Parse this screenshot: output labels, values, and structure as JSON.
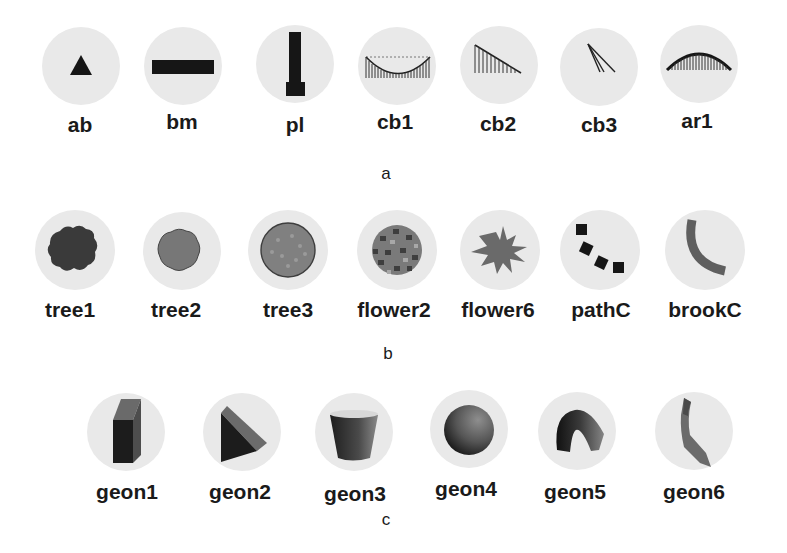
{
  "figure": {
    "panels": [
      {
        "letter": "a",
        "items": [
          {
            "label": "ab",
            "icon": "triangle-icon"
          },
          {
            "label": "bm",
            "icon": "horizontal-bar-icon"
          },
          {
            "label": "pl",
            "icon": "pillar-icon"
          },
          {
            "label": "cb1",
            "icon": "suspension-curve-icon"
          },
          {
            "label": "cb2",
            "icon": "cable-stay-fan-icon"
          },
          {
            "label": "cb3",
            "icon": "cable-lines-icon"
          },
          {
            "label": "ar1",
            "icon": "arch-icon"
          }
        ]
      },
      {
        "letter": "b",
        "items": [
          {
            "label": "tree1",
            "icon": "tree-dark-icon"
          },
          {
            "label": "tree2",
            "icon": "tree-medium-icon"
          },
          {
            "label": "tree3",
            "icon": "tree-textured-icon"
          },
          {
            "label": "flower2",
            "icon": "flower-cluster-icon"
          },
          {
            "label": "flower6",
            "icon": "flower-star-icon"
          },
          {
            "label": "pathC",
            "icon": "stepping-path-icon"
          },
          {
            "label": "brookC",
            "icon": "curved-brook-icon"
          }
        ]
      },
      {
        "letter": "c",
        "items": [
          {
            "label": "geon1",
            "icon": "box-geon-icon"
          },
          {
            "label": "geon2",
            "icon": "wedge-geon-icon"
          },
          {
            "label": "geon3",
            "icon": "truncated-cone-geon-icon"
          },
          {
            "label": "geon4",
            "icon": "sphere-geon-icon"
          },
          {
            "label": "geon5",
            "icon": "curved-tube-geon-icon"
          },
          {
            "label": "geon6",
            "icon": "bent-strip-geon-icon"
          }
        ]
      }
    ],
    "colors": {
      "circle_bg": "#e9e9e9",
      "ink": "#1a1a1a",
      "dark_fill": "#3c3c3c",
      "mid_fill": "#6e6e6e"
    }
  }
}
